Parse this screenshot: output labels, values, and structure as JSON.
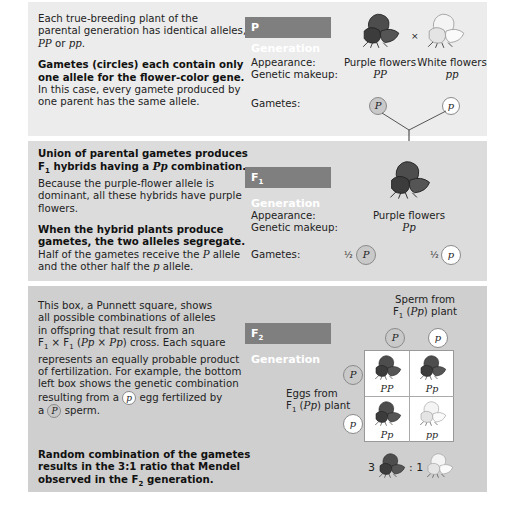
{
  "panels": {
    "p_generation": {
      "badge": "P Generation",
      "text1_a": "Each true-breeding plant of the",
      "text1_b": "parental generation has identical alleles,",
      "text1_c_geno1": "PP",
      "text1_c_or": " or ",
      "text1_c_geno2": "pp",
      "text1_c_end": ".",
      "text2_bold_a": "Gametes (circles) each contain only",
      "text2_bold_b": "one allele for the flower-color gene.",
      "text2_a": "In this case, every gamete produced by",
      "text2_b": "one parent has the same allele.",
      "appearance_label": "Appearance:",
      "genetic_label": "Genetic makeup:",
      "gametes_label": "Gametes:",
      "cross_symbol": "×",
      "parent1": {
        "appearance": "Purple flowers",
        "genotype": "PP",
        "gamete": "P"
      },
      "parent2": {
        "appearance": "White flowers",
        "genotype": "pp",
        "gamete": "p"
      }
    },
    "f1_generation": {
      "badge_prefix": "F",
      "badge_sub": "1",
      "badge_suffix": " Generation",
      "text1_bold_a": "Union of parental gametes produces",
      "text1_bold_b_pre": "F",
      "text1_bold_b_sub": "1",
      "text1_bold_b_mid": " hybrids having a ",
      "text1_bold_b_geno": "Pp",
      "text1_bold_b_end": " combination.",
      "text1_a": "Because the purple-flower allele is",
      "text1_b": "dominant, all these hybrids have purple",
      "text1_c": "flowers.",
      "text2_bold_a": "When the hybrid plants produce",
      "text2_bold_b": "gametes, the two alleles segregate.",
      "text2_a_pre": "Half of the gametes receive the ",
      "text2_a_allele": "P",
      "text2_a_end": " allele",
      "text2_b_pre": "and the other half the ",
      "text2_b_allele": "p",
      "text2_b_end": " allele.",
      "appearance_label": "Appearance:",
      "genetic_label": "Genetic makeup:",
      "gametes_label": "Gametes:",
      "appearance": "Purple flowers",
      "genotype": "Pp",
      "gamete1": {
        "fraction": "½",
        "allele": "P"
      },
      "gamete2": {
        "fraction": "½",
        "allele": "p"
      }
    },
    "f2_generation": {
      "badge_prefix": "F",
      "badge_sub": "2",
      "badge_suffix": " Generation",
      "text_a": "This box, a Punnett square, shows",
      "text_b": "all possible combinations of alleles",
      "text_c": "in offspring that result from an",
      "text_d_f": "F",
      "text_d_sub1": "1",
      "text_d_x": " × F",
      "text_d_sub2": "1",
      "text_d_paren": " (",
      "text_d_cross": "Pp × Pp",
      "text_d_end": ") cross. Each square",
      "text_e": "represents an equally probable product",
      "text_f": "of fertilization. For example, the bottom",
      "text_g": "left box shows the genetic combination",
      "text_h_pre": "resulting from a ",
      "text_h_allele": "p",
      "text_h_end": " egg fertilized by",
      "text_i_pre": "a ",
      "text_i_allele": "P",
      "text_i_end": " sperm.",
      "conclusion_bold_a": "Random combination of the gametes",
      "conclusion_bold_b": "results in the 3:1 ratio that Mendel",
      "conclusion_bold_c_pre": "observed in the F",
      "conclusion_bold_c_sub": "2",
      "conclusion_bold_c_end": " generation.",
      "sperm_label_a": "Sperm from",
      "sperm_label_b_f": "F",
      "sperm_label_b_sub": "1",
      "sperm_label_b_geno": "Pp",
      "sperm_label_b_end": " plant",
      "eggs_label_a": "Eggs from",
      "eggs_label_b_f": "F",
      "eggs_label_b_sub": "1",
      "eggs_label_b_geno": "Pp",
      "eggs_label_b_end": " plant",
      "sperm_alleles": [
        "P",
        "p"
      ],
      "egg_alleles": [
        "P",
        "p"
      ],
      "punnett": [
        [
          "PP",
          "Pp"
        ],
        [
          "Pp",
          "pp"
        ]
      ],
      "ratio_dominant": "3",
      "ratio_sep": ":",
      "ratio_recessive": "1"
    }
  },
  "colors": {
    "badge": "#7f7f7f",
    "panel1": "#ececec",
    "panel2": "#dcdcdc",
    "panel3": "#cfcfcf",
    "purple_flower": "#4a4a4a",
    "white_flower": "#f2f2f2"
  }
}
